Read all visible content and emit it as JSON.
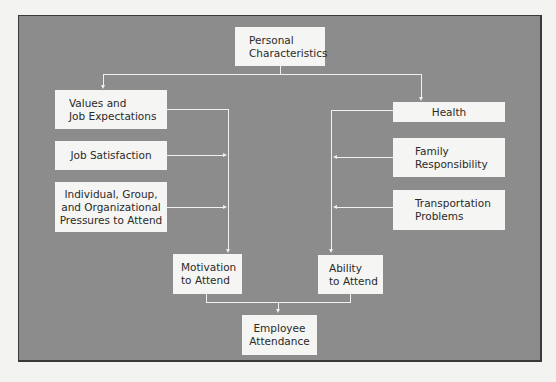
{
  "diagram": {
    "nodes": {
      "personal": {
        "line1": "Personal",
        "line2": "Characteristics"
      },
      "values": {
        "line1": "Values and",
        "line2": "Job Expectations"
      },
      "job_satisfaction": {
        "line1": "Job Satisfaction"
      },
      "pressures": {
        "line1": "Individual, Group,",
        "line2": "and Organizational",
        "line3": "Pressures to Attend"
      },
      "health": {
        "line1": "Health"
      },
      "family": {
        "line1": "Family",
        "line2": "Responsibility"
      },
      "transportation": {
        "line1": "Transportation",
        "line2": "Problems"
      },
      "motivation": {
        "line1": "Motivation",
        "line2": "to Attend"
      },
      "ability": {
        "line1": "Ability",
        "line2": "to Attend"
      },
      "attendance": {
        "line1": "Employee",
        "line2": "Attendance"
      }
    },
    "edges": [
      {
        "from": "Personal Characteristics",
        "to": "Values and Job Expectations"
      },
      {
        "from": "Personal Characteristics",
        "to": "Health"
      },
      {
        "from": "Values and Job Expectations",
        "to": "Motivation to Attend"
      },
      {
        "from": "Job Satisfaction",
        "to": "Motivation to Attend"
      },
      {
        "from": "Individual, Group, and Organizational Pressures to Attend",
        "to": "Motivation to Attend"
      },
      {
        "from": "Health",
        "to": "Ability to Attend"
      },
      {
        "from": "Family Responsibility",
        "to": "Ability to Attend"
      },
      {
        "from": "Transportation Problems",
        "to": "Ability to Attend"
      },
      {
        "from": "Motivation to Attend",
        "to": "Employee Attendance"
      },
      {
        "from": "Ability to Attend",
        "to": "Employee Attendance"
      }
    ],
    "colors": {
      "background": "#8c8c8c",
      "box": "#f5f5f3",
      "line": "#f0f0f0",
      "page": "#f3f3f1"
    }
  }
}
